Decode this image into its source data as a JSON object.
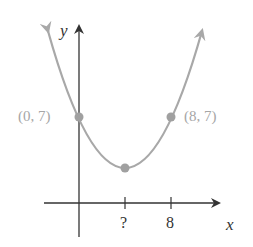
{
  "figure": {
    "type": "parabola-graph",
    "axes": {
      "x_label": "x",
      "y_label": "y"
    },
    "x_ticks": [
      {
        "label": "?"
      },
      {
        "label": "8"
      }
    ],
    "points": [
      {
        "label": "(0, 7)",
        "x": 0,
        "y": 7
      },
      {
        "label": "(8, 7)",
        "x": 8,
        "y": 7
      },
      {
        "label": "",
        "x": 4,
        "note": "vertex (x-coordinate marked ?)"
      }
    ],
    "colors": {
      "axis": "#333333",
      "curve": "#a8a8a8",
      "point": "#a0a0a0",
      "point_label": "#a6a6a6"
    }
  }
}
